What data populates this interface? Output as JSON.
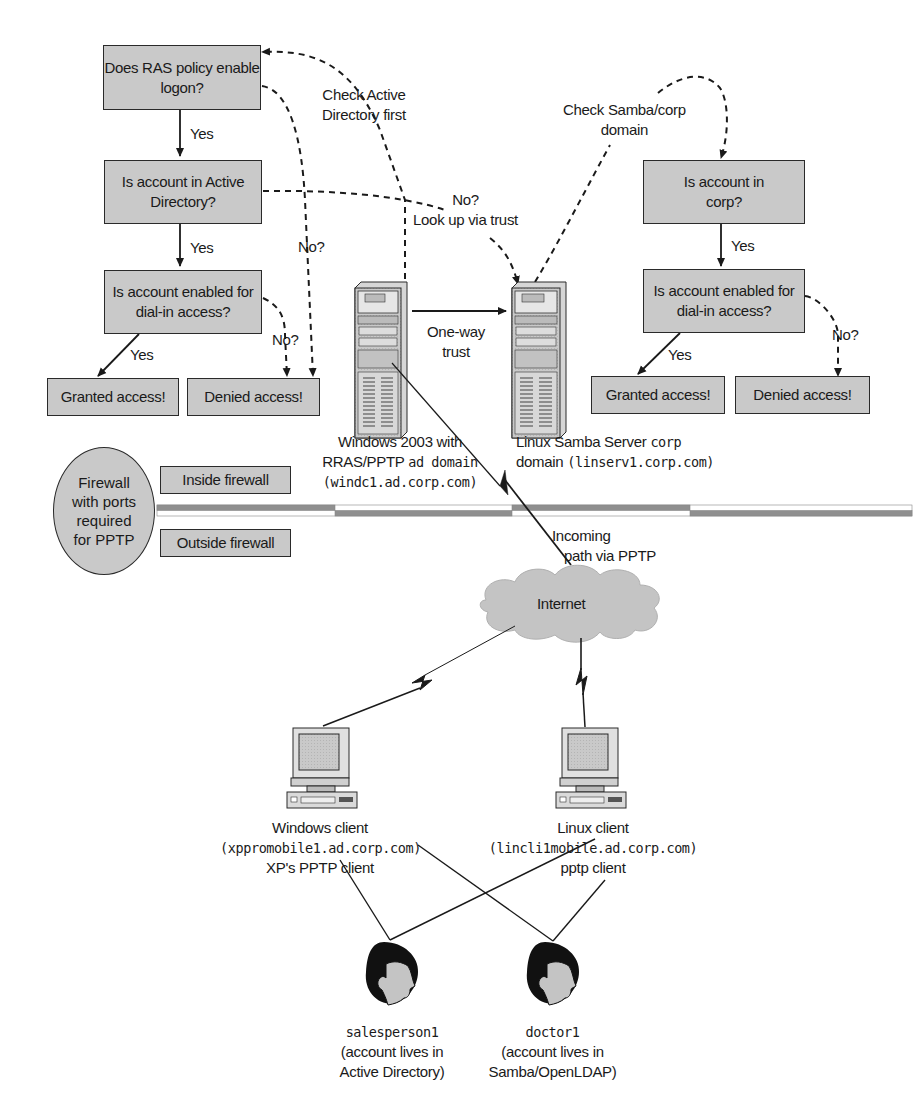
{
  "left_flow": {
    "q1": "Does RAS policy enable logon?",
    "q2": "Is account in Active Directory?",
    "q3": "Is account enabled for dial-in access?",
    "granted": "Granted access!",
    "denied": "Denied access!",
    "yes1": "Yes",
    "yes2": "Yes",
    "yes3": "Yes",
    "no1": "No?",
    "no2": "No?"
  },
  "right_flow": {
    "q1": "Is account in corp?",
    "q2": "Is account enabled for dial-in access?",
    "granted": "Granted access!",
    "denied": "Denied access!",
    "yes1": "Yes",
    "yes2": "Yes",
    "no": "No?"
  },
  "annotations": {
    "check_ad_line1": "Check Active",
    "check_ad_line2": "Directory first",
    "lookup_line1": "No?",
    "lookup_line2": "Look up via trust",
    "check_samba_line1": "Check Samba/corp",
    "check_samba_line2": "domain",
    "trust_line1": "One-way",
    "trust_line2": "trust",
    "incoming_line1": "Incoming",
    "incoming_line2": "path via PPTP"
  },
  "servers": {
    "windows": {
      "line1": "Windows 2003 with",
      "line2_a": "RRAS/PPTP ",
      "line2_b": "ad domain",
      "line3": "(windc1.ad.corp.com)"
    },
    "linux": {
      "line1_a": "Linux Samba Server ",
      "line1_b": "corp",
      "line2_a": "domain ",
      "line2_b": "(linserv1.corp.com)"
    }
  },
  "firewall": {
    "oval": [
      "Firewall",
      "with ports",
      "required",
      "for PPTP"
    ],
    "inside": "Inside firewall",
    "outside": "Outside firewall"
  },
  "internet": "Internet",
  "clients": {
    "windows": {
      "line1": "Windows client",
      "line2": "(xppromobile1.ad.corp.com)",
      "line3": "XP's PPTP client"
    },
    "linux": {
      "line1": "Linux client",
      "line2": "(lincli1mobile.ad.corp.com)",
      "line3": "pptp client"
    }
  },
  "users": {
    "salesperson": {
      "name": "salesperson1",
      "line2": "(account lives in",
      "line3": "Active Directory)"
    },
    "doctor": {
      "name": "doctor1",
      "line2": "(account lives in",
      "line3": "Samba/OpenLDAP)"
    }
  },
  "colors": {
    "box_fill": "#c9c9c9",
    "stroke": "#1a1a1a",
    "cloud": "#c4c4c4",
    "firewall_dark": "#8f8f8f"
  }
}
